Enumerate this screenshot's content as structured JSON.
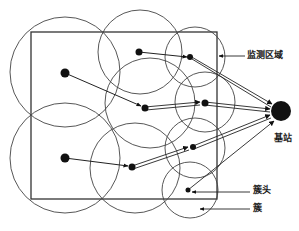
{
  "diagram": {
    "type": "wireless-sensor-network-clustering",
    "colors": {
      "line": "#333333",
      "node": "#111111",
      "background": "#ffffff"
    },
    "monitoring_area": {
      "x": 31,
      "y": 32,
      "width": 186,
      "height": 167
    },
    "base_station": {
      "x": 281,
      "y": 111,
      "r": 10
    },
    "clusters": [
      {
        "id": "c1",
        "cx": 65,
        "cy": 72,
        "r": 55,
        "node": {
          "x": 65,
          "y": 73,
          "r": 4.5
        },
        "head": null
      },
      {
        "id": "c2",
        "cx": 140,
        "cy": 52,
        "r": 42,
        "node": {
          "x": 139,
          "y": 52,
          "r": 3.5
        },
        "head": null
      },
      {
        "id": "c3",
        "cx": 195,
        "cy": 57,
        "r": 30,
        "node": null,
        "head": {
          "x": 190,
          "y": 57
        }
      },
      {
        "id": "c4",
        "cx": 150,
        "cy": 103,
        "r": 45,
        "node": null,
        "head": {
          "x": 145,
          "y": 108
        }
      },
      {
        "id": "c5",
        "cx": 205,
        "cy": 102,
        "r": 30,
        "node": null,
        "head": {
          "x": 205,
          "y": 103
        }
      },
      {
        "id": "c6",
        "cx": 65,
        "cy": 158,
        "r": 55,
        "node": {
          "x": 65,
          "y": 158,
          "r": 4.5
        },
        "head": null
      },
      {
        "id": "c7",
        "cx": 135,
        "cy": 168,
        "r": 45,
        "node": null,
        "head": {
          "x": 132,
          "y": 167
        }
      },
      {
        "id": "c8",
        "cx": 195,
        "cy": 148,
        "r": 30,
        "node": null,
        "head": {
          "x": 193,
          "y": 147
        }
      },
      {
        "id": "c9",
        "cx": 190,
        "cy": 190,
        "r": 28,
        "node": null,
        "head": {
          "x": 188,
          "y": 190
        }
      }
    ],
    "labels": {
      "monitoring_area": "监测区域",
      "base_station": "基站",
      "cluster_head": "簇头",
      "cluster": "簇"
    }
  }
}
